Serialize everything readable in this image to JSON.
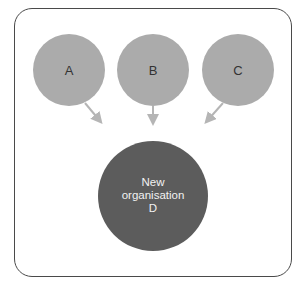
{
  "diagram": {
    "sources": [
      {
        "id": "A",
        "label": "A"
      },
      {
        "id": "B",
        "label": "B"
      },
      {
        "id": "C",
        "label": "C"
      }
    ],
    "target": {
      "line1": "New",
      "line2": "organisation",
      "line3": "D"
    },
    "colors": {
      "source_fill": "#ababab",
      "target_fill": "#5c5c5c",
      "arrow": "#b5b5b5",
      "frame": "#4a4a4a"
    }
  }
}
